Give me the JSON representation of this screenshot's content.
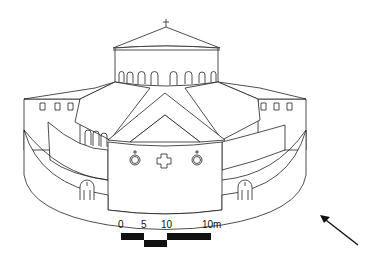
{
  "drawing": {
    "subject": "axonometric reconstruction of centrally-planned church with drum and dome",
    "line_color": "#222222",
    "background": "#ffffff"
  },
  "scale_bar": {
    "labels": [
      "0",
      "5",
      "10",
      "10m"
    ]
  },
  "north_arrow": {
    "icon": "arrow-northwest-icon"
  }
}
